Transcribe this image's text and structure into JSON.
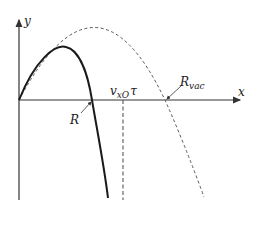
{
  "diagram": {
    "axes": {
      "x_label": "x",
      "y_label": "y"
    },
    "curves": [
      {
        "name": "trajectory-with-drag",
        "style": "solid",
        "range_label": "R"
      },
      {
        "name": "trajectory-vacuum",
        "style": "dashed",
        "range_label_main": "R",
        "range_label_sub": "vac"
      }
    ],
    "asymptote": {
      "label_main": "v",
      "label_sub": "xO",
      "label_tail": "τ",
      "style": "dashed"
    },
    "colors": {
      "solid_curve": "#1a1a1a",
      "dashed_curve": "#555555",
      "axes": "#333333"
    }
  }
}
